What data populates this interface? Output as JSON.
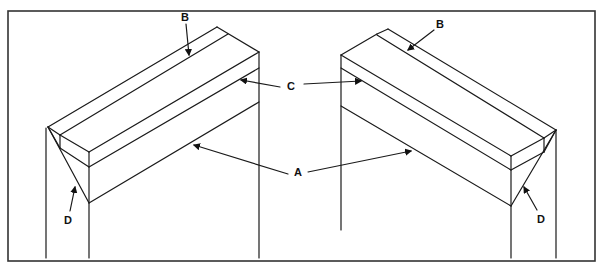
{
  "diagram": {
    "type": "technical-illustration",
    "labels": {
      "a": "A",
      "b": "B",
      "c": "C",
      "d": "D"
    },
    "views": [
      {
        "side": "left",
        "callouts": [
          "B",
          "C",
          "A",
          "D"
        ]
      },
      {
        "side": "right",
        "callouts": [
          "B",
          "C",
          "A",
          "D"
        ]
      }
    ],
    "colors": {
      "line": "#1a1a1a",
      "background": "#ffffff",
      "frame": "#333333"
    }
  }
}
